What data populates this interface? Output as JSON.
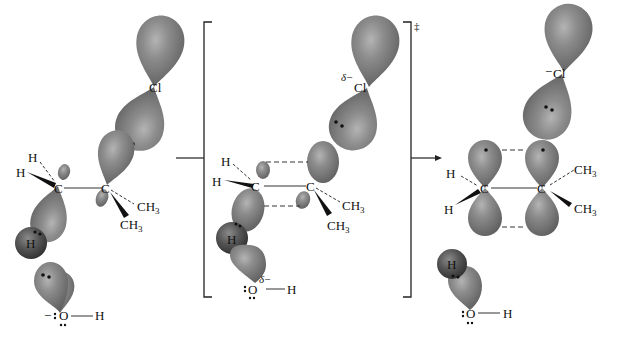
{
  "diagram": {
    "type": "reaction-mechanism",
    "colors": {
      "orbital": "#7f7f7f",
      "orbital_dark": "#555555",
      "hydrogen_sphere": "#4d4d4d",
      "line": "#222222",
      "background": "#ffffff"
    },
    "reactant": {
      "atoms": {
        "cl": "Cl",
        "c1": "C",
        "c2": "C",
        "h_top": "H",
        "h_wedge": "H",
        "h_sphere": "H",
        "ch3_dash": "CH",
        "ch3_wedge": "CH",
        "ch3_sub": "3",
        "oxygen": "O",
        "oh_h": "H",
        "o_charge": "−"
      }
    },
    "transition_state": {
      "atoms": {
        "cl": "Cl",
        "cl_partial": "δ−",
        "c1": "C",
        "c2": "C",
        "h_top": "H",
        "h_wedge": "H",
        "h_sphere": "H",
        "ch3_dash": "CH",
        "ch3_wedge": "CH",
        "ch3_sub": "3",
        "oxygen": "O",
        "o_partial": "δ−",
        "oh_h": "H"
      },
      "symbol": "‡"
    },
    "product": {
      "atoms": {
        "cl": "Cl",
        "cl_charge": "−",
        "c1": "C",
        "c2": "C",
        "h_top": "H",
        "h_wedge": "H",
        "ch3_top": "CH",
        "ch3_wedge": "CH",
        "ch3_sub": "3",
        "h_sphere": "H",
        "oxygen": "O",
        "oh_h": "H"
      }
    }
  }
}
